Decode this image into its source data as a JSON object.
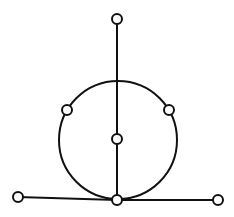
{
  "diagram": {
    "type": "graph",
    "colors": {
      "stroke": "#111111",
      "node_fill": "#ffffff",
      "background": "#ffffff"
    },
    "node_radius": 5,
    "stroke_width": 2,
    "big_circle": {
      "cx": 118,
      "cy": 140,
      "r": 59
    },
    "nodes": [
      {
        "id": "top",
        "x": 117,
        "y": 19
      },
      {
        "id": "circle-left",
        "x": 67,
        "y": 110
      },
      {
        "id": "circle-right",
        "x": 169,
        "y": 110
      },
      {
        "id": "center",
        "x": 117,
        "y": 139
      },
      {
        "id": "bottom-center",
        "x": 117,
        "y": 200
      },
      {
        "id": "bottom-left",
        "x": 18,
        "y": 197
      },
      {
        "id": "bottom-right",
        "x": 218,
        "y": 200
      }
    ],
    "edges": [
      {
        "from": "top",
        "to": "center"
      },
      {
        "from": "center",
        "to": "bottom-center"
      },
      {
        "from": "bottom-left",
        "to": "bottom-center"
      },
      {
        "from": "bottom-center",
        "to": "bottom-right"
      }
    ]
  }
}
